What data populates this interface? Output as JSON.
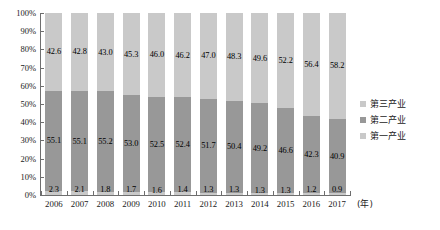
{
  "chart_data": {
    "type": "bar",
    "variant": "stacked-100-percent",
    "title": "",
    "subtitle": "",
    "xlabel": "(年)",
    "ylabel": "",
    "ylim": [
      0,
      100
    ],
    "ytick_labels": [
      "100%",
      "90%",
      "80%",
      "70%",
      "60%",
      "50%",
      "40%",
      "30%",
      "20%",
      "10%",
      "0%"
    ],
    "ytick_values": [
      100,
      90,
      80,
      70,
      60,
      50,
      40,
      30,
      20,
      10,
      0
    ],
    "grid": false,
    "legend_position": "right",
    "categories": [
      "2006",
      "2007",
      "2008",
      "2009",
      "2010",
      "2011",
      "2012",
      "2013",
      "2014",
      "2015",
      "2016",
      "2017"
    ],
    "series": [
      {
        "name": "第三产业",
        "color": "#c9c9c9",
        "values": [
          42.6,
          42.8,
          43.0,
          45.3,
          46.0,
          46.2,
          47.0,
          48.3,
          49.6,
          52.2,
          56.4,
          58.2
        ]
      },
      {
        "name": "第二产业",
        "color": "#989898",
        "values": [
          55.1,
          55.1,
          55.2,
          53.0,
          52.5,
          52.4,
          51.7,
          50.4,
          49.2,
          46.6,
          42.3,
          40.9
        ]
      },
      {
        "name": "第一产业",
        "color": "#c9c9c9",
        "values": [
          2.3,
          2.1,
          1.8,
          1.7,
          1.6,
          1.4,
          1.3,
          1.3,
          1.3,
          1.3,
          1.2,
          0.9
        ]
      }
    ]
  },
  "legend": {
    "items": [
      {
        "label": "第三产业",
        "color": "#c9c9c9"
      },
      {
        "label": "第二产业",
        "color": "#989898"
      },
      {
        "label": "第一产业",
        "color": "#c9c9c9"
      }
    ]
  },
  "axis": {
    "x_unit": "(年)"
  }
}
